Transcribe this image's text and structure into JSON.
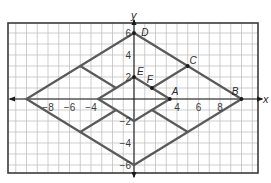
{
  "figure": {
    "type": "coordinate-plane-diagram",
    "x_axis": {
      "label": "x",
      "range": [
        -11.8,
        11.6
      ],
      "ticks": [
        -8,
        -6,
        -4,
        4,
        6,
        8
      ]
    },
    "y_axis": {
      "label": "y",
      "range": [
        -6.8,
        6.8
      ],
      "ticks": [
        6,
        4,
        2,
        -2,
        -4,
        -6
      ]
    },
    "grid_step": 1,
    "colors": {
      "shape": "#5a5a5a",
      "grid": "#b9b9b9",
      "axis": "#1a1a1a",
      "frame": "#3a3a3a"
    },
    "points": [
      {
        "name": "D",
        "x": 0,
        "y": 6,
        "label_dx": 1.0,
        "label_dy": 0.0
      },
      {
        "name": "C",
        "x": 5,
        "y": 3,
        "label_dx": 0.5,
        "label_dy": 0.5
      },
      {
        "name": "E",
        "x": 0,
        "y": 2,
        "label_dx": 0.6,
        "label_dy": 0.5
      },
      {
        "name": "F",
        "x": 1.667,
        "y": 1,
        "label_dx": -0.2,
        "label_dy": 0.7
      },
      {
        "name": "A",
        "x": 3.333,
        "y": 0,
        "label_dx": 0.5,
        "label_dy": 0.6
      },
      {
        "name": "B",
        "x": 10,
        "y": 0,
        "label_dx": -0.6,
        "label_dy": 0.6
      }
    ],
    "marked_points": [
      "D",
      "C",
      "E",
      "F",
      "A",
      "B"
    ],
    "segments": [
      {
        "name": "outer-rhombus-top-right",
        "from": [
          0,
          6
        ],
        "to": [
          10,
          0
        ]
      },
      {
        "name": "outer-rhombus-bottom-right",
        "from": [
          10,
          0
        ],
        "to": [
          0,
          -6
        ]
      },
      {
        "name": "outer-rhombus-bottom-left",
        "from": [
          0,
          -6
        ],
        "to": [
          -10,
          0
        ]
      },
      {
        "name": "outer-rhombus-top-left",
        "from": [
          -10,
          0
        ],
        "to": [
          0,
          6
        ]
      },
      {
        "name": "inner-rhombus-top-right",
        "from": [
          0,
          2
        ],
        "to": [
          3.333,
          0
        ]
      },
      {
        "name": "inner-rhombus-bottom-right",
        "from": [
          3.333,
          0
        ],
        "to": [
          0,
          -2
        ]
      },
      {
        "name": "inner-rhombus-bottom-left",
        "from": [
          0,
          -2
        ],
        "to": [
          -3.333,
          0
        ]
      },
      {
        "name": "inner-rhombus-top-left",
        "from": [
          -3.333,
          0
        ],
        "to": [
          0,
          2
        ]
      },
      {
        "name": "connector-top-right",
        "from": [
          1.667,
          1
        ],
        "to": [
          5,
          3
        ]
      },
      {
        "name": "connector-bottom-right",
        "from": [
          1.667,
          -1
        ],
        "to": [
          5,
          -3
        ]
      },
      {
        "name": "connector-bottom-left",
        "from": [
          -1.667,
          -1
        ],
        "to": [
          -5,
          -3
        ]
      },
      {
        "name": "connector-top-left",
        "from": [
          -1.667,
          1
        ],
        "to": [
          -5,
          3
        ]
      }
    ]
  }
}
